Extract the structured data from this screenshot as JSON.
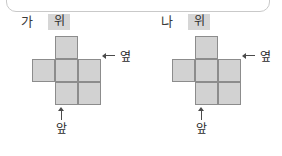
{
  "frame": {
    "shape": "rounded-rectangle",
    "border_color": "#c9c9c9"
  },
  "colors": {
    "cell_fill": "#d2d2d2",
    "cell_stroke": "#8c8c8c",
    "chip_background": "#d6d6d6",
    "text": "#2b2b2b",
    "arrow": "#4a4a4a",
    "page_background": "#ffffff"
  },
  "figures": [
    {
      "name": "가",
      "top_label": "위",
      "side_label": "옆",
      "front_label": "앞",
      "side_arrow": "arrow-left-icon",
      "front_arrow": "arrow-up-icon",
      "net": {
        "rows": 3,
        "cols": 3,
        "cells": [
          {
            "row": 1,
            "col": 2
          },
          {
            "row": 2,
            "col": 1
          },
          {
            "row": 2,
            "col": 2
          },
          {
            "row": 2,
            "col": 3
          },
          {
            "row": 3,
            "col": 2
          },
          {
            "row": 3,
            "col": 3
          }
        ]
      }
    },
    {
      "name": "나",
      "top_label": "위",
      "side_label": "옆",
      "front_label": "앞",
      "side_arrow": "arrow-left-icon",
      "front_arrow": "arrow-up-icon",
      "net": {
        "rows": 3,
        "cols": 3,
        "cells": [
          {
            "row": 1,
            "col": 2
          },
          {
            "row": 2,
            "col": 1
          },
          {
            "row": 2,
            "col": 2
          },
          {
            "row": 2,
            "col": 3
          },
          {
            "row": 3,
            "col": 2
          },
          {
            "row": 3,
            "col": 3
          }
        ]
      }
    }
  ]
}
